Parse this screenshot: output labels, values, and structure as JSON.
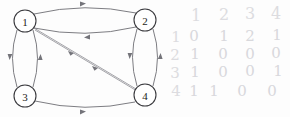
{
  "figure": {
    "background_color": "#fdfdfd"
  },
  "graph": {
    "type": "directed-multigraph",
    "node_stroke_color": "#3a3a3e",
    "edge_color": "#6e6e74",
    "nodes": [
      {
        "id": "1",
        "label": "1",
        "cx": 25,
        "cy": 21,
        "r": 11
      },
      {
        "id": "2",
        "label": "2",
        "cx": 145,
        "cy": 20,
        "r": 11
      },
      {
        "id": "3",
        "label": "3",
        "cx": 25,
        "cy": 96,
        "r": 11
      },
      {
        "id": "4",
        "label": "4",
        "cx": 145,
        "cy": 95,
        "r": 11
      }
    ],
    "edges": [
      {
        "from": "1",
        "to": "2",
        "style": "curve-up"
      },
      {
        "from": "2",
        "to": "1",
        "style": "curve-down"
      },
      {
        "from": "1",
        "to": "3",
        "style": "curve-left"
      },
      {
        "from": "3",
        "to": "1",
        "style": "curve-right"
      },
      {
        "from": "2",
        "to": "4",
        "style": "curve-left"
      },
      {
        "from": "4",
        "to": "2",
        "style": "curve-right"
      },
      {
        "from": "3",
        "to": "4",
        "style": "curve-slight"
      },
      {
        "from": "1",
        "to": "4",
        "style": "diagonal"
      },
      {
        "from": "1",
        "to": "4",
        "style": "diagonal-parallel"
      }
    ]
  },
  "matrix": {
    "handwritten": true,
    "ink_color": "#d8d8dc",
    "column_headers": [
      "1",
      "2",
      "3",
      "4"
    ],
    "row_labels": [
      "1",
      "2",
      "3",
      "4"
    ],
    "rows": [
      [
        "0",
        "1",
        "2",
        "1"
      ],
      [
        "1",
        "0",
        "0",
        "0"
      ],
      [
        "1",
        "0",
        "0",
        "1"
      ],
      [
        "1",
        "1",
        "0",
        "0"
      ]
    ]
  }
}
